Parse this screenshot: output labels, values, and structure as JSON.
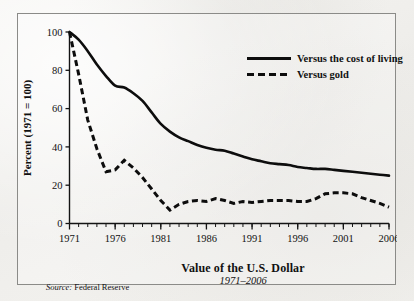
{
  "chart_data": {
    "type": "line",
    "title": "Value of the U.S. Dollar",
    "subtitle": "1971–2006",
    "xlabel": "Value of the U.S. Dollar",
    "ylabel": "Percent (1971 = 100)",
    "source": "Federal Reserve",
    "source_prefix": "Source:",
    "xlim": [
      1971,
      2006
    ],
    "ylim": [
      0,
      100
    ],
    "grid": false,
    "legend_position": "top-right",
    "y_ticks": [
      0,
      20,
      40,
      60,
      80,
      100
    ],
    "y_tick_labels": [
      "0",
      "20",
      "40",
      "60",
      "80",
      "100"
    ],
    "x_ticks": [
      1971,
      1976,
      1981,
      1986,
      1991,
      1996,
      2001,
      2006
    ],
    "x_tick_labels": [
      "1971",
      "1976",
      "1981",
      "1986",
      "1991",
      "1996",
      "2001",
      "2006"
    ],
    "x_minor_tick_step": 1,
    "x": [
      1971,
      1972,
      1973,
      1974,
      1975,
      1976,
      1977,
      1978,
      1979,
      1980,
      1981,
      1982,
      1983,
      1984,
      1985,
      1986,
      1987,
      1988,
      1989,
      1990,
      1991,
      1992,
      1993,
      1994,
      1995,
      1996,
      1997,
      1998,
      1999,
      2000,
      2001,
      2002,
      2003,
      2004,
      2005,
      2006
    ],
    "series": [
      {
        "name": "Versus the cost of living",
        "style": "solid",
        "color": "#0d0d0d",
        "values": [
          100,
          96,
          90,
          83,
          77,
          72,
          71,
          68,
          64,
          58,
          52,
          48,
          45,
          43,
          41,
          39.5,
          38.5,
          38,
          36.5,
          35,
          33.5,
          32.5,
          31.5,
          31,
          30.5,
          29.5,
          29,
          28.5,
          28.5,
          28,
          27.5,
          27,
          26.5,
          26,
          25.5,
          25
        ]
      },
      {
        "name": "Versus gold",
        "style": "dashed",
        "color": "#0d0d0d",
        "values": [
          100,
          78,
          54,
          39,
          27,
          28,
          33,
          29,
          24,
          18,
          12,
          7,
          10,
          11.5,
          12,
          11.5,
          13,
          12,
          10.5,
          11.5,
          11,
          11.5,
          12,
          12,
          12,
          11.5,
          11.5,
          13,
          15.5,
          16,
          16,
          15.5,
          13.5,
          12,
          10.5,
          8.5
        ]
      }
    ],
    "annotations": []
  },
  "legend": {
    "items": [
      {
        "label": "Versus the cost of living",
        "style": "solid"
      },
      {
        "label": "Versus gold",
        "style": "dashed"
      }
    ]
  }
}
